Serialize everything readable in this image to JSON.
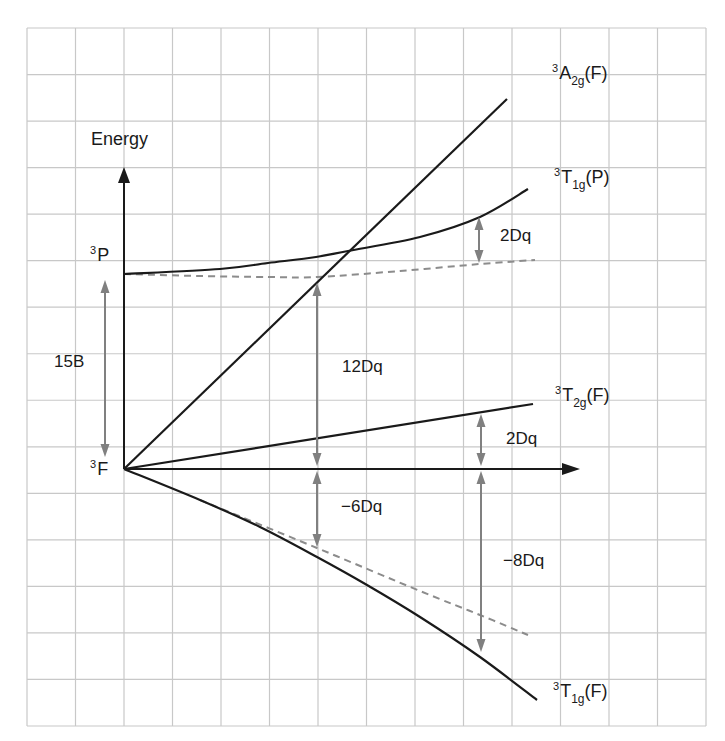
{
  "diagram": {
    "axis": {
      "y_label": "Energy",
      "origin": [
        124,
        469
      ],
      "y_axis_top": 167,
      "x_axis_end": 580
    },
    "grid": {
      "x0": 27,
      "y0": 28,
      "x1": 706,
      "y1": 726,
      "columns": 14,
      "rows": 15,
      "color": "#c8c8c8"
    },
    "colors": {
      "line": "#1a1a1a",
      "arrow_gray": "#808080",
      "dashed": "#8c8c8c",
      "background": "#ffffff"
    },
    "free_ion_terms": [
      {
        "sup": "3",
        "term": "P",
        "x": 90,
        "y": 246
      },
      {
        "sup": "3",
        "term": "F",
        "x": 90,
        "y": 460
      }
    ],
    "states": [
      {
        "id": "A2g_F",
        "sup": "3",
        "main": "A",
        "sub": "2g",
        "tail": "(F)",
        "x": 552,
        "y": 60
      },
      {
        "id": "T1g_P",
        "sup": "3",
        "main": "T",
        "sub": "1g",
        "tail": "(P)",
        "x": 554,
        "y": 166
      },
      {
        "id": "T2g_F",
        "sup": "3",
        "main": "T",
        "sub": "2g",
        "tail": "(F)",
        "x": 555,
        "y": 383
      },
      {
        "id": "T1g_F",
        "sup": "3",
        "main": "T",
        "sub": "1g",
        "tail": "(F)",
        "x": 553,
        "y": 679
      }
    ],
    "curves": {
      "A2g_F": [
        [
          124,
          469
        ],
        [
          507,
          99
        ]
      ],
      "T2g_F": [
        [
          124,
          469
        ],
        [
          533,
          404
        ]
      ],
      "T1g_P": [
        [
          124,
          274
        ],
        [
          220,
          269
        ],
        [
          268,
          263
        ],
        [
          316,
          257
        ],
        [
          348,
          251
        ],
        [
          420,
          237
        ],
        [
          480,
          217
        ],
        [
          528,
          189
        ]
      ],
      "T1g_F": [
        [
          124,
          469
        ],
        [
          200,
          500
        ],
        [
          260,
          527
        ],
        [
          317,
          557
        ],
        [
          367,
          585
        ],
        [
          420,
          617
        ],
        [
          480,
          657
        ],
        [
          537,
          700
        ]
      ],
      "T1g_P_dashed": [
        [
          124,
          274
        ],
        [
          200,
          276
        ],
        [
          268,
          277
        ],
        [
          317,
          277
        ],
        [
          400,
          271
        ],
        [
          480,
          264
        ],
        [
          535,
          260
        ]
      ],
      "T1g_F_dashed": [
        [
          200,
          500
        ],
        [
          317,
          548
        ],
        [
          420,
          591
        ],
        [
          480,
          615
        ],
        [
          528,
          635
        ]
      ]
    },
    "gaps": [
      {
        "label": "15B",
        "x": 105,
        "y1": 280,
        "y2": 457,
        "label_x": 54,
        "label_y": 353
      },
      {
        "label": "12Dq",
        "x": 317,
        "y1": 283,
        "y2": 466,
        "label_x": 342,
        "label_y": 358
      },
      {
        "label": "2Dq",
        "x": 479,
        "y1": 217,
        "y2": 263,
        "label_x": 500,
        "label_y": 226
      },
      {
        "label": "2Dq",
        "x": 481,
        "y1": 414,
        "y2": 466,
        "label_x": 506,
        "label_y": 429
      },
      {
        "label": "−6Dq",
        "x": 317,
        "y1": 471,
        "y2": 547,
        "label_x": 341,
        "label_y": 497
      },
      {
        "label": "−8Dq",
        "x": 481,
        "y1": 471,
        "y2": 652,
        "label_x": 503,
        "label_y": 551
      }
    ]
  }
}
